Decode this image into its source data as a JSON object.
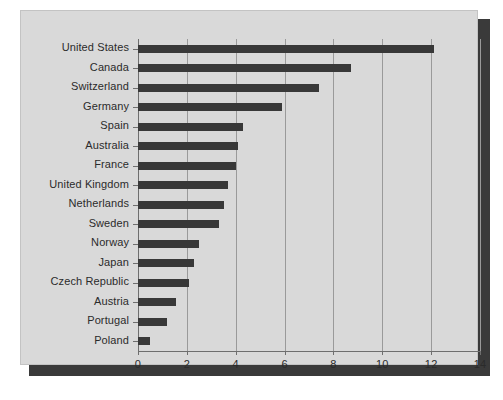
{
  "figure": {
    "panel_background": "#d9d9d9",
    "bar_color": "#383838",
    "grid_color": "#9a9a9a",
    "axis_color": "#6e6e6e",
    "text_color": "#2b2b2b"
  },
  "chart_data": {
    "type": "bar",
    "orientation": "horizontal",
    "title": "",
    "subtitle": "",
    "xlabel": "",
    "ylabel": "",
    "xlim": [
      0,
      14
    ],
    "ylim": null,
    "grid": true,
    "gridlines_axis": "x",
    "legend": false,
    "legend_position": "none",
    "xticks": [
      0,
      2,
      4,
      6,
      8,
      10,
      12,
      14
    ],
    "xticklabels": [
      "0",
      "2",
      "4",
      "6",
      "8",
      "10",
      "12",
      "14"
    ],
    "categories": [
      "United States",
      "Canada",
      "Switzerland",
      "Germany",
      "Spain",
      "Australia",
      "France",
      "United Kingdom",
      "Netherlands",
      "Sweden",
      "Norway",
      "Japan",
      "Czech Republic",
      "Austria",
      "Portugal",
      "Poland"
    ],
    "values": [
      12.1,
      8.7,
      7.4,
      5.9,
      4.3,
      4.1,
      4.0,
      3.7,
      3.5,
      3.3,
      2.5,
      2.3,
      2.1,
      1.55,
      1.2,
      0.5
    ]
  }
}
